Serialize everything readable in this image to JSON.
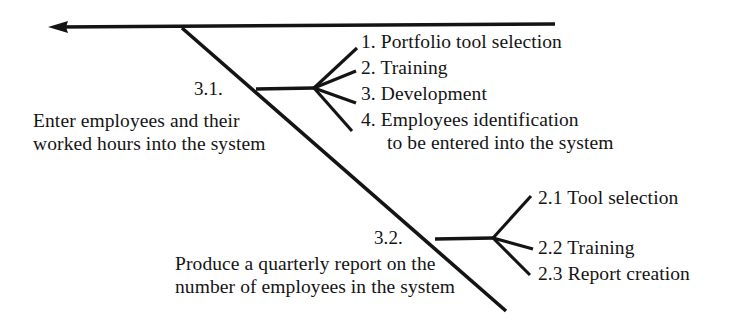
{
  "diagram": {
    "type": "fishbone-ishikawa",
    "colors": {
      "line": "#141414",
      "text": "#141414",
      "background": "#ffffff"
    },
    "spine": {
      "name": "main-spine-arrow",
      "direction": "left"
    },
    "branches": [
      {
        "id": "3.1",
        "number_label": "3.1.",
        "effect_line_1": "Enter employees and their",
        "effect_line_2": "worked hours into the system",
        "causes": [
          {
            "label": "1. Portfolio tool selection",
            "continuation": ""
          },
          {
            "label": "2. Training",
            "continuation": ""
          },
          {
            "label": "3. Development",
            "continuation": ""
          },
          {
            "label": "4. Employees identification",
            "continuation": "to be entered into the system"
          }
        ]
      },
      {
        "id": "3.2",
        "number_label": "3.2.",
        "effect_line_1": "Produce a quarterly report on the",
        "effect_line_2": "number of employees in the system",
        "causes": [
          {
            "label": "2.1 Tool selection",
            "continuation": ""
          },
          {
            "label": "2.2 Training",
            "continuation": ""
          },
          {
            "label": "2.3 Report creation",
            "continuation": ""
          }
        ]
      }
    ]
  }
}
